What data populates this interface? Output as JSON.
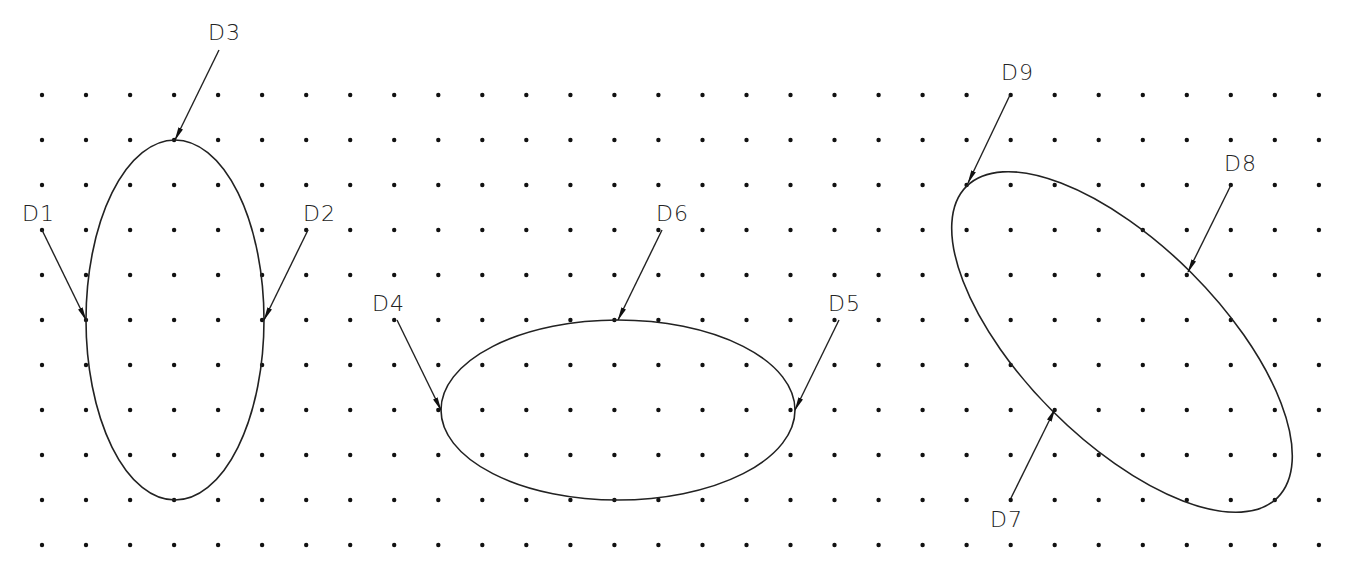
{
  "grid": {
    "x_start": 42,
    "x_step": 44.03,
    "cols": 30,
    "y_start": 95,
    "y_step": 45,
    "rows": 11,
    "dot_radius": 2.2
  },
  "ellipses": [
    {
      "id": "vertical-ellipse",
      "cx": 175,
      "cy": 320,
      "rx": 89,
      "ry": 180,
      "rotate": 0
    },
    {
      "id": "horizontal-ellipse",
      "cx": 618,
      "cy": 410,
      "rx": 177,
      "ry": 90,
      "rotate": 0
    },
    {
      "id": "rotated-ellipse",
      "cx": 1122,
      "cy": 342,
      "rx": 220,
      "ry": 98,
      "rotate": 45
    }
  ],
  "callouts": [
    {
      "label": "D1",
      "text_x": 22,
      "text_y": 221,
      "from": [
        42,
        230
      ],
      "to": [
        86,
        320
      ]
    },
    {
      "label": "D2",
      "text_x": 303,
      "text_y": 221,
      "from": [
        308,
        230
      ],
      "to": [
        264,
        320
      ]
    },
    {
      "label": "D3",
      "text_x": 208,
      "text_y": 40,
      "from": [
        219,
        50
      ],
      "to": [
        175,
        140
      ]
    },
    {
      "label": "D4",
      "text_x": 372,
      "text_y": 311,
      "from": [
        397,
        320
      ],
      "to": [
        441,
        410
      ]
    },
    {
      "label": "D5",
      "text_x": 828,
      "text_y": 311,
      "from": [
        839,
        320
      ],
      "to": [
        795,
        410
      ]
    },
    {
      "label": "D6",
      "text_x": 656,
      "text_y": 221,
      "from": [
        662,
        230
      ],
      "to": [
        618,
        320
      ]
    },
    {
      "label": "D7",
      "text_x": 990,
      "text_y": 527,
      "from": [
        1011,
        498
      ],
      "to": [
        1055,
        409
      ]
    },
    {
      "label": "D8",
      "text_x": 1224,
      "text_y": 171,
      "from": [
        1231,
        185
      ],
      "to": [
        1188,
        272
      ]
    },
    {
      "label": "D9",
      "text_x": 1001,
      "text_y": 80,
      "from": [
        1010,
        95
      ],
      "to": [
        968,
        183
      ]
    }
  ]
}
